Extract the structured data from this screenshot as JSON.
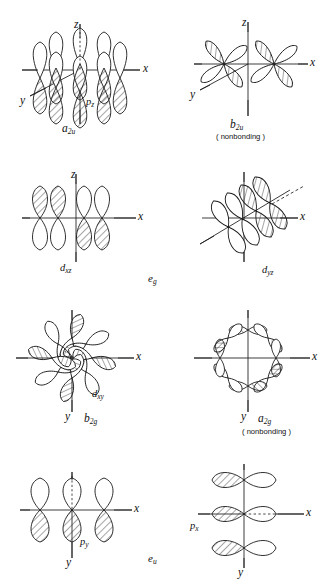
{
  "figure": {
    "title_cropped": "",
    "ink_color": "#1a1a1a",
    "background_color": "#ffffff",
    "hatch_color": "#2a2a2a"
  },
  "axis_labels": {
    "x": "x",
    "y": "y",
    "z": "z"
  },
  "panels": [
    {
      "id": "a2u",
      "symmetry": "a",
      "symmetry_sub": "2u",
      "orbital": "p",
      "orbital_sub": "z",
      "note": "",
      "axes": [
        "z",
        "x",
        "y"
      ],
      "row": 1,
      "column": 1
    },
    {
      "id": "b2u",
      "symmetry": "b",
      "symmetry_sub": "2u",
      "orbital": "",
      "orbital_sub": "",
      "note": "( nonbonding )",
      "axes": [
        "z",
        "x",
        "y"
      ],
      "row": 1,
      "column": 2
    },
    {
      "id": "dxz",
      "symmetry": "",
      "symmetry_sub": "",
      "orbital": "d",
      "orbital_sub": "xz",
      "note": "",
      "axes": [
        "z",
        "x"
      ],
      "row": 2,
      "column": 1
    },
    {
      "id": "dyz",
      "symmetry": "",
      "symmetry_sub": "",
      "orbital": "d",
      "orbital_sub": "yz",
      "note": "",
      "axes": [
        "x"
      ],
      "row": 2,
      "column": 2
    },
    {
      "id": "b2g",
      "symmetry": "b",
      "symmetry_sub": "2g",
      "orbital": "d",
      "orbital_sub": "xy",
      "note": "",
      "axes": [
        "x",
        "y"
      ],
      "row": 3,
      "column": 1
    },
    {
      "id": "a2g",
      "symmetry": "a",
      "symmetry_sub": "2g",
      "orbital": "",
      "orbital_sub": "",
      "note": "( nonbonding )",
      "axes": [
        "x",
        "y"
      ],
      "row": 3,
      "column": 2
    },
    {
      "id": "py",
      "symmetry": "",
      "symmetry_sub": "",
      "orbital": "p",
      "orbital_sub": "y",
      "note": "",
      "axes": [
        "x",
        "y"
      ],
      "row": 4,
      "column": 1
    },
    {
      "id": "px",
      "symmetry": "",
      "symmetry_sub": "",
      "orbital": "p",
      "orbital_sub": "x",
      "note": "",
      "axes": [
        "x",
        "y"
      ],
      "row": 4,
      "column": 2
    }
  ],
  "row_labels": [
    {
      "id": "eg",
      "text": "e",
      "sub": "g",
      "row": 2
    },
    {
      "id": "eu",
      "text": "e",
      "sub": "u",
      "row": 4
    }
  ]
}
